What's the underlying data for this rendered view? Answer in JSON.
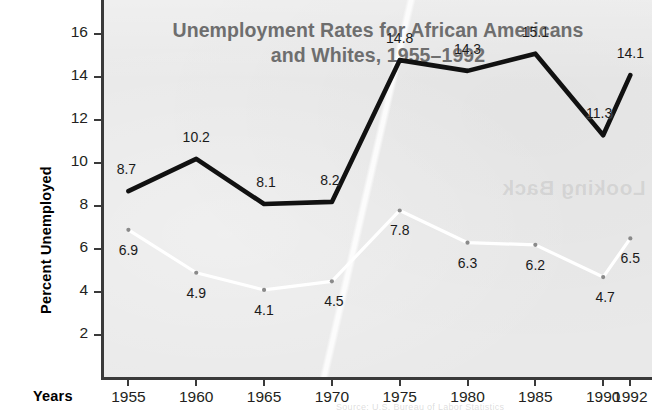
{
  "chart_data": {
    "type": "line",
    "title_lines": [
      "Unemployment Rates for African Americans",
      "and Whites, 1955–1992"
    ],
    "xlabel": "Years",
    "ylabel": "Percent Unemployed",
    "categories": [
      "1955",
      "1960",
      "1965",
      "1970",
      "1975",
      "1980",
      "1985",
      "1990",
      "1992"
    ],
    "x": [
      1955,
      1960,
      1965,
      1970,
      1975,
      1980,
      1985,
      1990,
      1992
    ],
    "xlim": [
      1953.2,
      1993.6
    ],
    "ylim": [
      0,
      17.6
    ],
    "yticks": [
      2,
      4,
      6,
      8,
      10,
      12,
      14,
      16
    ],
    "ytick_labels": [
      "2",
      "4",
      "6",
      "8",
      "10",
      "12",
      "14",
      "16"
    ],
    "grid": false,
    "legend": "none",
    "series": [
      {
        "name": "African Americans",
        "color": "#111111",
        "marker": "none",
        "values": [
          8.7,
          10.2,
          8.1,
          8.2,
          14.8,
          14.3,
          15.1,
          11.3,
          14.1
        ],
        "labels": [
          "8.7",
          "10.2",
          "8.1",
          "8.2",
          "14.8",
          "14.3",
          "15.1",
          "11.3",
          "14.1"
        ],
        "label_offsets": [
          {
            "dx": -2,
            "dy": -22
          },
          {
            "dx": 0,
            "dy": -22
          },
          {
            "dx": 2,
            "dy": -22
          },
          {
            "dx": -2,
            "dy": -22
          },
          {
            "dx": 0,
            "dy": -22
          },
          {
            "dx": 0,
            "dy": -22
          },
          {
            "dx": 0,
            "dy": -22
          },
          {
            "dx": -4,
            "dy": -22
          },
          {
            "dx": 0,
            "dy": -22
          }
        ]
      },
      {
        "name": "Whites",
        "color": "#ffffff",
        "marker": "dot",
        "marker_color": "#8a8a8a",
        "values": [
          6.9,
          4.9,
          4.1,
          4.5,
          7.8,
          6.3,
          6.2,
          4.7,
          6.5
        ],
        "labels": [
          "6.9",
          "4.9",
          "4.1",
          "4.5",
          "7.8",
          "6.3",
          "6.2",
          "4.7",
          "6.5"
        ],
        "label_offsets": [
          {
            "dx": 0,
            "dy": 20
          },
          {
            "dx": 0,
            "dy": 20
          },
          {
            "dx": 0,
            "dy": 20
          },
          {
            "dx": 2,
            "dy": 20
          },
          {
            "dx": 0,
            "dy": 20
          },
          {
            "dx": 0,
            "dy": 20
          },
          {
            "dx": 0,
            "dy": 20
          },
          {
            "dx": 2,
            "dy": 20
          },
          {
            "dx": 0,
            "dy": 20
          }
        ]
      }
    ]
  },
  "artifacts": {
    "ghost_text": "Looking Back",
    "footer_bleed": "Source: U.S. Bureau of Labor Statistics"
  },
  "colors": {
    "panel_background": "#e9e9e9",
    "page_background": "#ffffff",
    "axis": "#3a3a3a",
    "title": "#6e6e6e",
    "series_african_americans": "#111111",
    "series_whites": "#ffffff",
    "marker": "#8a8a8a",
    "text": "#231f20"
  }
}
